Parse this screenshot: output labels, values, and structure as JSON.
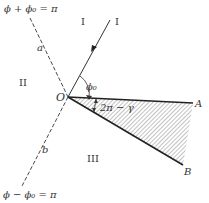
{
  "diagram": {
    "equations": {
      "top": "ϕ + ϕ₀ = π",
      "bottom": "ϕ − ϕ₀ = π"
    },
    "regions": {
      "region_1_left": "I",
      "region_1_right": "I",
      "region_2": "II",
      "region_3": "III"
    },
    "line_labels": {
      "a": "a",
      "b": "b"
    },
    "points": {
      "origin": "O",
      "A": "A",
      "B": "B"
    },
    "angles": {
      "phi0": "ϕ₀",
      "wedge": "2π − γ"
    },
    "colors": {
      "ink": "#222222",
      "hatch": "#555555",
      "background": "#ffffff"
    }
  }
}
